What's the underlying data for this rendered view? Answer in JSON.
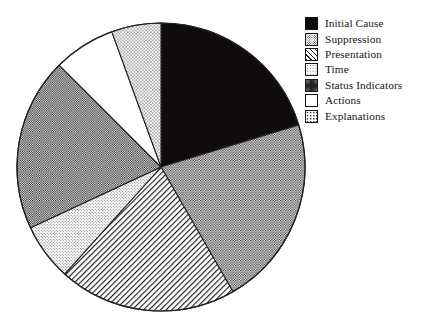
{
  "chart_data": {
    "type": "pie",
    "title": "",
    "subtitle": "",
    "xlabel": "",
    "ylabel": "",
    "grid": false,
    "legend_position": "right",
    "start_angle_deg": 0,
    "direction": "clockwise",
    "center": {
      "x": 161,
      "y": 167
    },
    "radius": 144,
    "categories": [
      "Initial Cause",
      "Suppression",
      "Presentation",
      "Time",
      "Status Indicators",
      "Actions",
      "Explanations"
    ],
    "values": [
      20.3,
      21.4,
      20.0,
      6.4,
      19.4,
      6.9,
      5.6
    ],
    "slices": [
      {
        "label": "Initial Cause",
        "value": 20.3,
        "start_deg": 0,
        "end_deg": 73,
        "sweep_deg": 73,
        "pattern": "solid-black",
        "fill": "#100c0c"
      },
      {
        "label": "Suppression",
        "value": 21.4,
        "start_deg": 73,
        "end_deg": 150,
        "sweep_deg": 77,
        "pattern": "dots-medium",
        "fill": "#a8a8a8"
      },
      {
        "label": "Presentation",
        "value": 20.0,
        "start_deg": 150,
        "end_deg": 222,
        "sweep_deg": 72,
        "pattern": "hatch-diagonal",
        "fill": "#cfcfcf"
      },
      {
        "label": "Time",
        "value": 6.4,
        "start_deg": 222,
        "end_deg": 245,
        "sweep_deg": 23,
        "pattern": "dots-light",
        "fill": "#e2e2e2"
      },
      {
        "label": "Status Indicators",
        "value": 19.4,
        "start_deg": 245,
        "end_deg": 315,
        "sweep_deg": 70,
        "pattern": "checker-dark",
        "fill": "#9a9a9a"
      },
      {
        "label": "Actions",
        "value": 6.9,
        "start_deg": 315,
        "end_deg": 340,
        "sweep_deg": 25,
        "pattern": "white",
        "fill": "#ffffff"
      },
      {
        "label": "Explanations",
        "value": 5.6,
        "start_deg": 340,
        "end_deg": 360,
        "sweep_deg": 20,
        "pattern": "dots-sparse",
        "fill": "#e8e8e8"
      }
    ]
  },
  "legend": {
    "items": [
      {
        "label": "Initial Cause",
        "swatch": "solid-black",
        "swatch_class": "sw-solid-black"
      },
      {
        "label": "Suppression",
        "swatch": "dots-medium",
        "swatch_class": "sw-dots-medium"
      },
      {
        "label": "Presentation",
        "swatch": "hatch-diagonal",
        "swatch_class": "sw-hatch-diagonal"
      },
      {
        "label": "Time",
        "swatch": "dots-light",
        "swatch_class": "sw-dots-light"
      },
      {
        "label": "Status Indicators",
        "swatch": "checker-dark",
        "swatch_class": "sw-checker-dark"
      },
      {
        "label": "Actions",
        "swatch": "white",
        "swatch_class": "sw-white"
      },
      {
        "label": "Explanations",
        "swatch": "dots-sparse",
        "swatch_class": "sw-dots-sparse"
      }
    ]
  },
  "colors": {
    "outline": "#222222",
    "background": "#ffffff",
    "text": "#161616"
  }
}
